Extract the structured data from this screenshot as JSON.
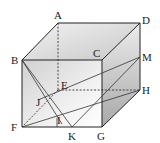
{
  "diagram": {
    "type": "cuboid-geometry",
    "labels": {
      "A": "A",
      "B": "B",
      "C": "C",
      "D": "D",
      "E": "E",
      "F": "F",
      "G": "G",
      "H": "H",
      "I": "I",
      "J": "J",
      "K": "K",
      "M": "M"
    },
    "points": {
      "A": [
        58,
        23
      ],
      "B": [
        22,
        60
      ],
      "C": [
        102,
        60
      ],
      "D": [
        140,
        23
      ],
      "E": [
        58,
        90
      ],
      "F": [
        22,
        127
      ],
      "G": [
        102,
        127
      ],
      "H": [
        140,
        90
      ],
      "M": [
        140,
        57
      ],
      "K": [
        72,
        127
      ],
      "J": [
        38,
        100
      ],
      "I": [
        57,
        118
      ]
    },
    "segments_solid": [
      [
        "A",
        "D"
      ],
      [
        "A",
        "B"
      ],
      [
        "D",
        "C"
      ],
      [
        "B",
        "C"
      ],
      [
        "D",
        "H"
      ],
      [
        "C",
        "G"
      ],
      [
        "B",
        "F"
      ],
      [
        "F",
        "G"
      ],
      [
        "G",
        "H"
      ],
      [
        "B",
        "K"
      ],
      [
        "B",
        "I"
      ],
      [
        "J",
        "M"
      ],
      [
        "F",
        "H"
      ],
      [
        "M",
        "K"
      ]
    ],
    "segments_dashed": [
      [
        "A",
        "E"
      ],
      [
        "E",
        "H"
      ],
      [
        "E",
        "F"
      ]
    ],
    "colors": {
      "line": "#222222",
      "top_face": "#d9d9d9",
      "front_face": "#eaeaea",
      "side_face": "#bdbdbd"
    }
  }
}
